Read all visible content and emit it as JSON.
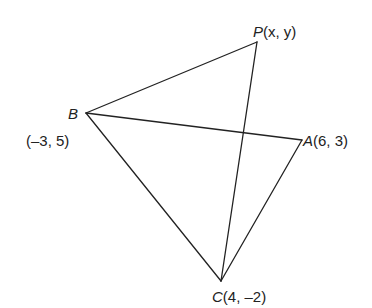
{
  "diagram": {
    "type": "geometry-figure",
    "stroke_color": "#222222",
    "points": {
      "P": {
        "name": "P",
        "coords_label": "(x, y)",
        "px": [
          257,
          42
        ]
      },
      "B": {
        "name": "B",
        "coords_label": "(–3, 5)",
        "px": [
          86,
          113
        ]
      },
      "A": {
        "name": "A",
        "coords_label": "(6, 3)",
        "px": [
          302,
          140
        ]
      },
      "C": {
        "name": "C",
        "coords_label": "(4, –2)",
        "px": [
          221,
          281
        ]
      }
    },
    "segments": [
      [
        "B",
        "P"
      ],
      [
        "P",
        "C"
      ],
      [
        "B",
        "A"
      ],
      [
        "B",
        "C"
      ],
      [
        "A",
        "C"
      ]
    ]
  }
}
